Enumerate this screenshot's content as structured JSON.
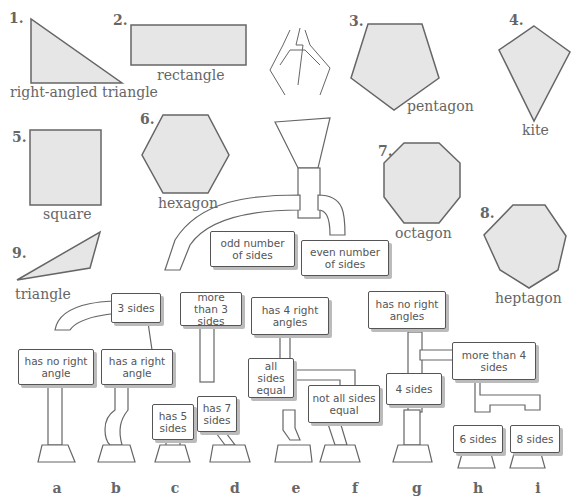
{
  "colors": {
    "shape_fill": "#e6e6e6",
    "shape_stroke": "#666666",
    "sign_border": "#555555",
    "text": "#555555"
  },
  "shapes": [
    {
      "number": "1.",
      "name": "right-angled triangle"
    },
    {
      "number": "2.",
      "name": "rectangle"
    },
    {
      "number": "3.",
      "name": "pentagon"
    },
    {
      "number": "4.",
      "name": "kite"
    },
    {
      "number": "5.",
      "name": "square"
    },
    {
      "number": "6.",
      "name": "hexagon"
    },
    {
      "number": "7.",
      "name": "octagon"
    },
    {
      "number": "8.",
      "name": "heptagon"
    },
    {
      "number": "9.",
      "name": "triangle"
    }
  ],
  "signs": {
    "odd": "odd number of sides",
    "even": "even number of sides",
    "three_sides": "3 sides",
    "more_than_3": "more than 3 sides",
    "has_4_right": "has 4 right angles",
    "no_right_angles": "has no right angles",
    "no_right_angle": "has no right angle",
    "a_right_angle": "has a right angle",
    "five_sides": "has 5 sides",
    "seven_sides": "has 7 sides",
    "all_equal": "all sides equal",
    "not_all_equal": "not all sides equal",
    "four_sides": "4 sides",
    "more_than_4": "more than 4 sides",
    "six_sides": "6 sides",
    "eight_sides": "8 sides"
  },
  "outlets": [
    "a",
    "b",
    "c",
    "d",
    "e",
    "f",
    "g",
    "h",
    "i"
  ]
}
